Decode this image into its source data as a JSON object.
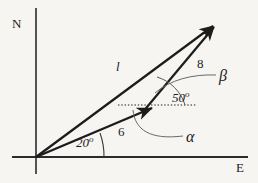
{
  "figure": {
    "background_color": "#f6f5f2",
    "stroke_color": "#1c1c1c",
    "arc_color": "#555555"
  },
  "axes": {
    "north_label": "N",
    "east_label": "E",
    "origin": {
      "x": 36,
      "y": 157
    },
    "vertical_top": {
      "x": 36,
      "y": 8
    },
    "horizontal_right": {
      "x": 248,
      "y": 157
    }
  },
  "vectors": [
    {
      "name": "resultant",
      "label": "l",
      "label_style": "italic",
      "from": {
        "x": 36,
        "y": 157
      },
      "to": {
        "x": 218,
        "y": 23
      }
    },
    {
      "name": "first-leg",
      "label": "6",
      "magnitude": 6,
      "from": {
        "x": 36,
        "y": 157
      },
      "to": {
        "x": 157,
        "y": 106
      }
    },
    {
      "name": "second-leg",
      "label": "8",
      "magnitude": 8,
      "from": {
        "x": 144,
        "y": 111
      },
      "to": {
        "x": 218,
        "y": 23
      }
    }
  ],
  "dotted_reference_line": {
    "name": "horizontal-reference",
    "from": {
      "x": 118,
      "y": 105
    },
    "to": {
      "x": 196,
      "y": 105
    }
  },
  "angles": [
    {
      "name": "bearing-angle",
      "label": "20",
      "degree_symbol": "o",
      "value": 20,
      "unit": "degrees"
    },
    {
      "name": "interior-angle",
      "label": "50",
      "degree_symbol": "o",
      "value": 50,
      "unit": "degrees"
    },
    {
      "name": "alpha-angle",
      "label": "α"
    },
    {
      "name": "beta-angle",
      "label": "β"
    }
  ]
}
